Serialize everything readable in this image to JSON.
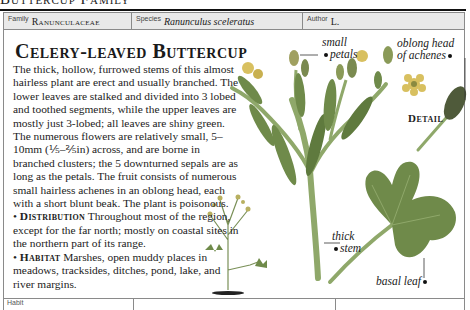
{
  "running_head": "Buttercup Family",
  "header": {
    "family_label": "Family",
    "family_value": "Ranunculaceae",
    "species_label": "Species",
    "species_value": "Ranunculus sceleratus",
    "author_label": "Author",
    "author_value": "L."
  },
  "title": "Celery-leaved Buttercup",
  "description": "The thick, hollow, furrowed stems of this almost hairless plant are erect and usually branched. The lower leaves are stalked and divided into 3 lobed and toothed segments, while the upper leaves are mostly just 3-lobed; all leaves are shiny green. The numerous flowers are relatively small, 5–10mm (⅕–⅖in) across, and are borne in branched clusters; the 5 downturned sepals are as long as the petals. The fruit consists of numerous small hairless achenes in an oblong head, each with a short blunt beak. The plant is poisonous.",
  "distribution": {
    "heading": "Distribution",
    "text": "Throughout most of the region, except for the far north; mostly on coastal sites in the northern part of its range."
  },
  "habitat": {
    "heading": "Habitat",
    "text": "Marshes, open muddy places in meadows, tracksides, ditches, pond, lake, and river margins."
  },
  "annotations": {
    "small_petals_1": "small",
    "small_petals_2": "petals",
    "oblong_head_1": "oblong head",
    "oblong_head_2": "of achenes",
    "detail": "Detail",
    "thick_stem_1": "thick",
    "thick_stem_2": "stem",
    "basal_leaf": "basal leaf"
  },
  "bullet": "•",
  "bottom_row": {
    "cell1_label": "Habit"
  },
  "colors": {
    "header_bg": "#e9e9e9",
    "border": "#8a8a8a",
    "leaf": "#6f8a4a",
    "stem": "#8fa86a",
    "flower": "#d8c060"
  }
}
